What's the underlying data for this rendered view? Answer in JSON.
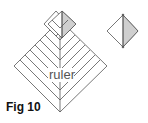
{
  "figure": {
    "caption": "Fig 10",
    "center_label": "ruler"
  },
  "colors": {
    "stroke": "#555555",
    "shade": "#cfcfcf",
    "background": "#ffffff"
  }
}
